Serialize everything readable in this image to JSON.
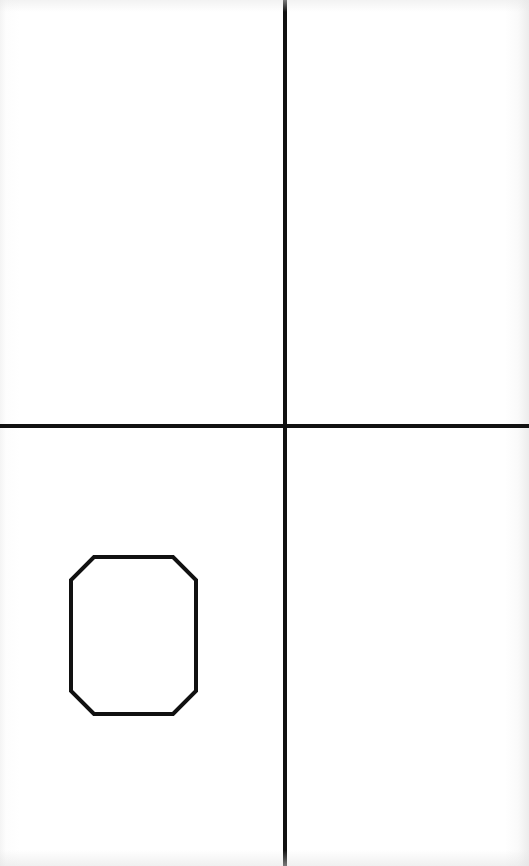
{
  "diagram": {
    "type": "geometric-figure",
    "canvas": {
      "width": 529,
      "height": 866,
      "background": "#ffffff"
    },
    "stroke_color": "#111111",
    "elements": [
      {
        "kind": "line",
        "role": "vertical-axis",
        "x1": 285,
        "y1": 0,
        "x2": 285,
        "y2": 866,
        "stroke_width": 4
      },
      {
        "kind": "line",
        "role": "horizontal-axis",
        "x1": 0,
        "y1": 426,
        "x2": 529,
        "y2": 426,
        "stroke_width": 4
      },
      {
        "kind": "polygon",
        "role": "octagon",
        "quadrant": "lower-left",
        "points": [
          [
            94,
            557
          ],
          [
            173,
            557
          ],
          [
            196,
            580
          ],
          [
            196,
            691
          ],
          [
            173,
            714
          ],
          [
            94,
            714
          ],
          [
            71,
            691
          ],
          [
            71,
            580
          ]
        ],
        "stroke_width": 4,
        "fill": "none"
      }
    ]
  }
}
